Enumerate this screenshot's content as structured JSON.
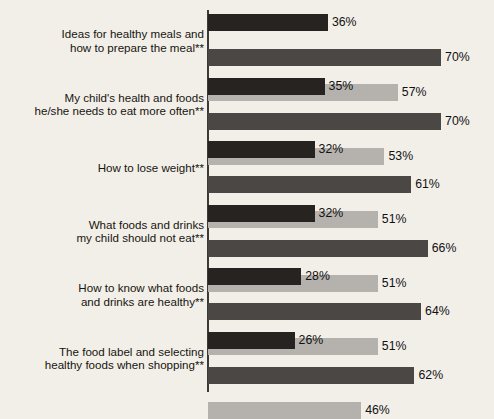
{
  "chart_data": {
    "type": "bar",
    "orientation": "horizontal",
    "grouped": true,
    "title": "",
    "xlabel": "",
    "ylabel": "",
    "xlim": [
      0,
      86
    ],
    "grid": false,
    "legend_position": "none",
    "value_suffix": "%",
    "categories": [
      "Ideas for healthy meals and\nhow to prepare the meal**",
      "My child's health and foods\nhe/she needs to eat more often**",
      "How to lose weight**",
      "What foods and drinks\nmy child should not eat**",
      "How to know what foods\nand drinks are healthy**",
      "The food label and selecting\nhealthy foods when shopping**"
    ],
    "series": [
      {
        "name": "series-1",
        "color": "#262320",
        "values": [
          36,
          35,
          32,
          32,
          28,
          26
        ],
        "labels": [
          "36%",
          "35%",
          "32%",
          "32%",
          "28%",
          "26%"
        ]
      },
      {
        "name": "series-2",
        "color": "#4a4745",
        "values": [
          70,
          70,
          61,
          66,
          64,
          62
        ],
        "labels": [
          "70%",
          "70%",
          "61%",
          "66%",
          "64%",
          "62%"
        ]
      },
      {
        "name": "series-3",
        "color": "#b5b2ae",
        "values": [
          57,
          53,
          51,
          51,
          51,
          46
        ],
        "labels": [
          "57%",
          "53%",
          "51%",
          "51%",
          "51%",
          "46%"
        ]
      }
    ],
    "axis_color": "#3d3a35",
    "background_color": "#f2efe9"
  }
}
